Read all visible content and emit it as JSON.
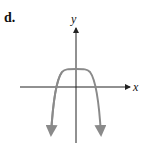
{
  "figure": {
    "part_label": "d.",
    "x_axis_label": "x",
    "y_axis_label": "y",
    "curve_description": "downward-opening even-degree polynomial, flat near peak above origin, both ends pointing down",
    "colors": {
      "axes": "#222222",
      "curve": "#8a8a8a"
    }
  }
}
